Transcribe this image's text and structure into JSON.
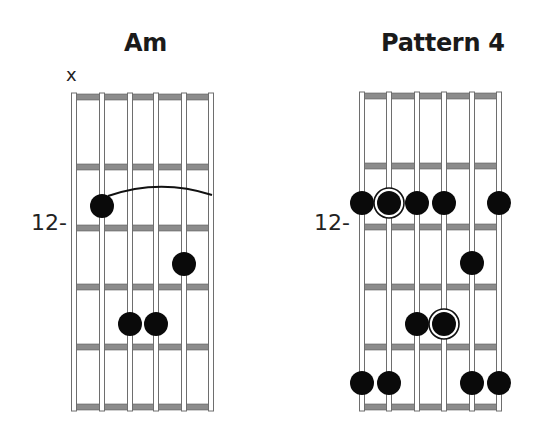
{
  "diagrams": [
    {
      "title": "Am",
      "muted_marker": "x",
      "muted_string": 1,
      "fret_label": "12-",
      "fret_label_row": 2,
      "geometry": {
        "string_x": [
          74,
          102,
          130,
          156,
          184,
          211
        ],
        "fret_y": [
          97,
          167,
          228,
          287,
          347,
          407
        ]
      },
      "dots": [
        {
          "string": 2,
          "y": 206,
          "root": false
        },
        {
          "string": 5,
          "y": 264,
          "root": false
        },
        {
          "string": 3,
          "y": 324,
          "root": false
        },
        {
          "string": 4,
          "y": 324,
          "root": false
        }
      ],
      "slur": {
        "from_x": 108,
        "from_y": 196,
        "ctrl_x": 160,
        "ctrl_y": 178,
        "to_x": 212,
        "to_y": 195
      }
    },
    {
      "title": "Pattern 4",
      "fret_label": "12-",
      "fret_label_row": 2,
      "geometry": {
        "string_x": [
          362,
          389,
          417,
          444,
          472,
          499
        ],
        "fret_y": [
          96,
          166,
          227,
          287,
          347,
          407
        ]
      },
      "dots": [
        {
          "string": 1,
          "y": 203,
          "root": false
        },
        {
          "string": 2,
          "y": 203,
          "root": true
        },
        {
          "string": 3,
          "y": 203,
          "root": false
        },
        {
          "string": 4,
          "y": 203,
          "root": false
        },
        {
          "string": 6,
          "y": 203,
          "root": false
        },
        {
          "string": 5,
          "y": 263,
          "root": false
        },
        {
          "string": 3,
          "y": 324,
          "root": false
        },
        {
          "string": 4,
          "y": 324,
          "root": true
        },
        {
          "string": 1,
          "y": 383,
          "root": false
        },
        {
          "string": 2,
          "y": 383,
          "root": false
        },
        {
          "string": 5,
          "y": 383,
          "root": false
        },
        {
          "string": 6,
          "y": 383,
          "root": false
        }
      ]
    }
  ],
  "colors": {
    "dot": "#0a0a0a",
    "string_fill": "#ffffff",
    "string_outline": "#6e6e6e",
    "fret_fill": "#8c8c8c",
    "fret_outline": "#5a5a5a",
    "text": "#1a1a1a"
  }
}
